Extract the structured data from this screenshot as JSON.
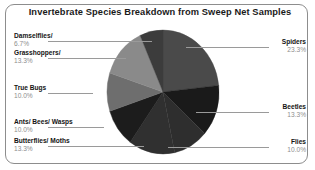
{
  "frame": {
    "name": "chart-border"
  },
  "chart_data": {
    "type": "pie",
    "title": "Invertebrate Species Breakdown from Sweep Net Samples",
    "xlabel": "",
    "ylabel": "",
    "units": "percent",
    "legend_position": "callout-labels",
    "grid": false,
    "start_angle_deg": 0,
    "direction": "clockwise",
    "categories": [
      "Spiders",
      "Beetles",
      "Flies",
      "Butterflies/ Moths",
      "Ants/ Bees/ Wasps",
      "True Bugs",
      "Grasshoppers/",
      "Damselflies/"
    ],
    "values": [
      23.3,
      13.3,
      10.0,
      13.3,
      10.0,
      10.0,
      13.3,
      6.7
    ],
    "value_labels": [
      "23.3%",
      "13.3%",
      "10.0%",
      "13.3%",
      "10.0%",
      "10.0%",
      "13.3%",
      "6.7%"
    ],
    "colors": [
      "#4a4a4a",
      "#1a1a1a",
      "#2e2e2e",
      "#303030",
      "#1c1c1c",
      "#6e6e6e",
      "#8a8a8a",
      "#3c3c3c"
    ],
    "slices": [
      {
        "label": "Spiders",
        "value": 23.3,
        "value_label": "23.3%",
        "color": "#4a4a4a",
        "side": "right"
      },
      {
        "label": "Beetles",
        "value": 13.3,
        "value_label": "13.3%",
        "color": "#1a1a1a",
        "side": "right"
      },
      {
        "label": "Flies",
        "value": 10.0,
        "value_label": "10.0%",
        "color": "#2e2e2e",
        "side": "right"
      },
      {
        "label": "Butterflies/ Moths",
        "value": 13.3,
        "value_label": "13.3%",
        "color": "#303030",
        "side": "left"
      },
      {
        "label": "Ants/ Bees/ Wasps",
        "value": 10.0,
        "value_label": "10.0%",
        "color": "#1c1c1c",
        "side": "left"
      },
      {
        "label": "True Bugs",
        "value": 10.0,
        "value_label": "10.0%",
        "color": "#6e6e6e",
        "side": "left"
      },
      {
        "label": "Grasshoppers/",
        "value": 13.3,
        "value_label": "13.3%",
        "color": "#8a8a8a",
        "side": "left"
      },
      {
        "label": "Damselflies/",
        "value": 6.7,
        "value_label": "6.7%",
        "color": "#3c3c3c",
        "side": "left"
      }
    ]
  }
}
